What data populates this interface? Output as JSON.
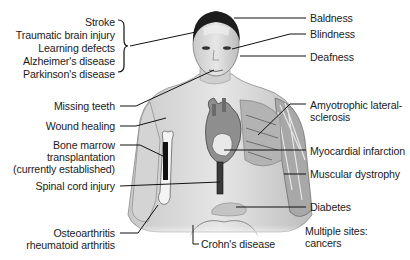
{
  "diagram": {
    "title": "",
    "colors": {
      "background": "#ffffff",
      "text": "#1a1a1a",
      "line": "#111111",
      "skin": "#d9d9d9",
      "muscle": "#9a9a9a",
      "bone": "#f2f2f2",
      "dark": "#1c1c1c"
    },
    "left_labels": {
      "brain_group": [
        "Stroke",
        "Traumatic brain injury",
        "Learning defects",
        "Alzheimer's disease",
        "Parkinson's disease"
      ],
      "missing_teeth": "Missing teeth",
      "wound_healing": "Wound healing",
      "bone_marrow": [
        "Bone marrow",
        "transplantation",
        "(currently established)"
      ],
      "spinal_cord": "Spinal cord injury",
      "arthritis": [
        "Osteoarthritis",
        "rheumatoid arthritis"
      ]
    },
    "right_labels": {
      "baldness": "Baldness",
      "blindness": "Blindness",
      "deafness": "Deafness",
      "als": [
        "Amyotrophic lateral-",
        "sclerosis"
      ],
      "myocardial": "Myocardial infarction",
      "muscular": "Muscular dystrophy",
      "diabetes": "Diabetes",
      "multiple_sites": [
        "Multiple sites:",
        "cancers"
      ]
    },
    "bottom_labels": {
      "crohns": "Crohn's disease"
    }
  }
}
